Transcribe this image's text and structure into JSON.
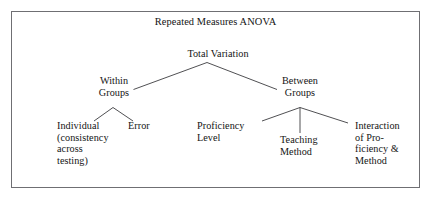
{
  "figure": {
    "title": "Repeated Measures ANOVA",
    "border_color": "#6f6f73",
    "line_color": "#3c3c40",
    "text_color": "#141414",
    "background": "#ffffff"
  },
  "diagram": {
    "type": "tree",
    "nodes": {
      "total_variation": "Total Variation",
      "within_groups": "Within\nGroups",
      "between_groups": "Between\nGroups",
      "individual": "Individual\n(consistency\nacross\ntesting)",
      "error": "Error",
      "proficiency_level": "Proficiency\nLevel",
      "teaching_method": "Teaching\nMethod",
      "interaction": "Interaction\nof Pro-\nficiency &\nMethod"
    },
    "edges": [
      {
        "from": "total_variation",
        "to": "within_groups"
      },
      {
        "from": "total_variation",
        "to": "between_groups"
      },
      {
        "from": "within_groups",
        "to": "individual"
      },
      {
        "from": "within_groups",
        "to": "error"
      },
      {
        "from": "between_groups",
        "to": "proficiency_level"
      },
      {
        "from": "between_groups",
        "to": "teaching_method"
      },
      {
        "from": "between_groups",
        "to": "interaction"
      }
    ]
  }
}
